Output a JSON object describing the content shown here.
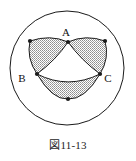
{
  "figure": {
    "caption": "図11-13",
    "alt_name": "three-overlapping-arcs-in-circle",
    "background_color": "#ffffff",
    "stroke_color": "#1a1a1a",
    "shade_color": "#9a9a9a",
    "shade_pattern": "stipple-gray",
    "outer_circle": {
      "cx": 67,
      "cy": 68,
      "r": 57,
      "stroke_width": 1,
      "fill": "#ffffff"
    },
    "labels": [
      {
        "text": "A",
        "x": 66,
        "y": 36
      },
      {
        "text": "B",
        "x": 22,
        "y": 82
      },
      {
        "text": "C",
        "x": 108,
        "y": 82
      }
    ],
    "vertex_dots": [
      {
        "name": "dot-top-center",
        "x": 68,
        "y": 42,
        "r": 2.1
      },
      {
        "name": "dot-upper-left",
        "x": 30,
        "y": 41,
        "r": 2.1
      },
      {
        "name": "dot-upper-right",
        "x": 105,
        "y": 41,
        "r": 2.1
      },
      {
        "name": "dot-mid-left",
        "x": 37,
        "y": 74,
        "r": 2.1
      },
      {
        "name": "dot-mid-right",
        "x": 100,
        "y": 74,
        "r": 2.1
      },
      {
        "name": "dot-bottom-center",
        "x": 68,
        "y": 99,
        "r": 2.1
      }
    ],
    "petals": [
      {
        "name": "petal-upper-left",
        "path": "M 30 41 Q 50 34 68 42 Q 56 60 37 74 Q 26 58 30 41 Z"
      },
      {
        "name": "petal-upper-right",
        "path": "M 105 41 Q 86 34 68 42 Q 81 60 100 74 Q 110 58 105 41 Z"
      },
      {
        "name": "petal-bottom",
        "path": "M 37 74 Q 52 100 68 99 Q 85 100 100 74 Q 68 90 37 74 Z"
      }
    ],
    "arcs": [
      {
        "name": "arc-left-outer",
        "path": "M 30 41 Q 26 58 37 74"
      },
      {
        "name": "arc-right-outer",
        "path": "M 105 41 Q 110 58 100 74"
      },
      {
        "name": "arc-top",
        "path": "M 30 41 Q 50 34 68 42 Q 86 34 105 41"
      },
      {
        "name": "arc-inner-left",
        "path": "M 68 42 Q 56 60 37 74"
      },
      {
        "name": "arc-inner-right",
        "path": "M 68 42 Q 81 60 100 74"
      },
      {
        "name": "arc-bottom-outer",
        "path": "M 37 74 Q 52 100 68 99 Q 85 100 100 74"
      },
      {
        "name": "arc-bottom-inner",
        "path": "M 37 74 Q 68 90 100 74"
      }
    ]
  }
}
